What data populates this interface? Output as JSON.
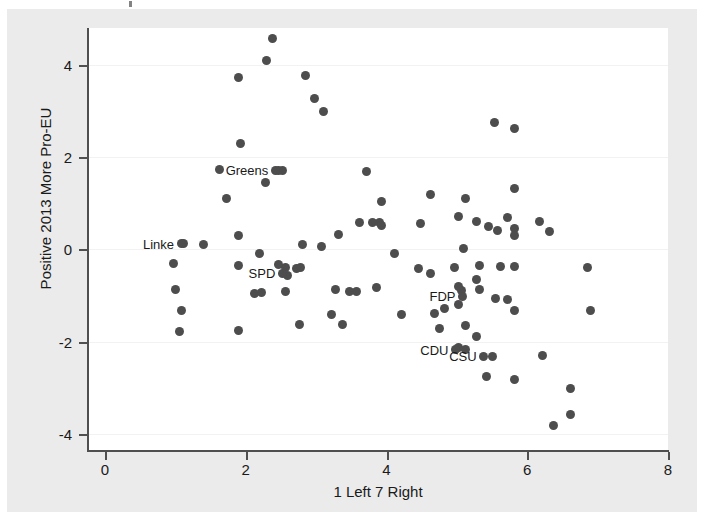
{
  "figure": {
    "background_color": "#ebebeb",
    "plot_background_color": "#ffffff",
    "marker_color": "#4d4d4d",
    "axis_color": "#4f4f4f",
    "gridline_color": "#f2f2f2"
  },
  "chart_data": {
    "type": "scatter",
    "title": "",
    "xlabel": "1 Left 7 Right",
    "ylabel": "Positive 2013 More Pro-EU",
    "xlim": [
      0,
      8
    ],
    "ylim": [
      -4.35,
      4.8
    ],
    "xticks": [
      0,
      2,
      4,
      6,
      8
    ],
    "xtick_labels": [
      "0",
      "2",
      "4",
      "6",
      "8"
    ],
    "yticks": [
      -4,
      -2,
      0,
      2,
      4
    ],
    "ytick_labels": [
      "-4",
      "-2",
      "0",
      "2",
      "4"
    ],
    "grid": "horizontal",
    "legend": "none",
    "annotations": [
      {
        "label": "Greens",
        "x": 2.42,
        "y": 1.72,
        "anchor": "right"
      },
      {
        "label": "Linke",
        "x": 1.08,
        "y": 0.12,
        "anchor": "right"
      },
      {
        "label": "SPD",
        "x": 2.52,
        "y": -0.52,
        "anchor": "right"
      },
      {
        "label": "FDP",
        "x": 5.08,
        "y": -1.02,
        "anchor": "right"
      },
      {
        "label": "CDU",
        "x": 4.98,
        "y": -2.18,
        "anchor": "right"
      },
      {
        "label": "CSU",
        "x": 5.38,
        "y": -2.32,
        "anchor": "right"
      }
    ],
    "points": [
      {
        "x": 2.38,
        "y": 4.58
      },
      {
        "x": 2.3,
        "y": 4.1
      },
      {
        "x": 1.9,
        "y": 3.72
      },
      {
        "x": 2.85,
        "y": 3.78
      },
      {
        "x": 2.98,
        "y": 3.28
      },
      {
        "x": 3.1,
        "y": 3.0
      },
      {
        "x": 1.92,
        "y": 2.3
      },
      {
        "x": 5.53,
        "y": 2.76
      },
      {
        "x": 5.82,
        "y": 2.62
      },
      {
        "x": 1.62,
        "y": 1.74
      },
      {
        "x": 2.46,
        "y": 1.72
      },
      {
        "x": 2.52,
        "y": 1.7
      },
      {
        "x": 2.28,
        "y": 1.46
      },
      {
        "x": 3.72,
        "y": 1.68
      },
      {
        "x": 5.82,
        "y": 1.32
      },
      {
        "x": 1.72,
        "y": 1.1
      },
      {
        "x": 4.62,
        "y": 1.18
      },
      {
        "x": 5.12,
        "y": 1.1
      },
      {
        "x": 3.93,
        "y": 1.04
      },
      {
        "x": 5.02,
        "y": 0.72
      },
      {
        "x": 5.72,
        "y": 0.7
      },
      {
        "x": 5.28,
        "y": 0.6
      },
      {
        "x": 6.18,
        "y": 0.6
      },
      {
        "x": 3.62,
        "y": 0.58
      },
      {
        "x": 3.8,
        "y": 0.58
      },
      {
        "x": 3.9,
        "y": 0.58
      },
      {
        "x": 3.93,
        "y": 0.52
      },
      {
        "x": 4.48,
        "y": 0.56
      },
      {
        "x": 5.45,
        "y": 0.5
      },
      {
        "x": 5.58,
        "y": 0.42
      },
      {
        "x": 5.82,
        "y": 0.46
      },
      {
        "x": 5.82,
        "y": 0.3
      },
      {
        "x": 6.32,
        "y": 0.38
      },
      {
        "x": 1.9,
        "y": 0.3
      },
      {
        "x": 3.32,
        "y": 0.32
      },
      {
        "x": 2.8,
        "y": 0.1
      },
      {
        "x": 3.08,
        "y": 0.06
      },
      {
        "x": 1.12,
        "y": 0.12
      },
      {
        "x": 1.4,
        "y": 0.1
      },
      {
        "x": 5.1,
        "y": 0.02
      },
      {
        "x": 2.2,
        "y": -0.08
      },
      {
        "x": 4.12,
        "y": -0.08
      },
      {
        "x": 0.98,
        "y": -0.3
      },
      {
        "x": 1.9,
        "y": -0.34
      },
      {
        "x": 2.46,
        "y": -0.32
      },
      {
        "x": 2.56,
        "y": -0.4
      },
      {
        "x": 2.72,
        "y": -0.42
      },
      {
        "x": 2.78,
        "y": -0.4
      },
      {
        "x": 2.6,
        "y": -0.56
      },
      {
        "x": 4.45,
        "y": -0.42
      },
      {
        "x": 4.62,
        "y": -0.52
      },
      {
        "x": 4.96,
        "y": -0.4
      },
      {
        "x": 5.32,
        "y": -0.34
      },
      {
        "x": 5.62,
        "y": -0.38
      },
      {
        "x": 5.82,
        "y": -0.38
      },
      {
        "x": 6.86,
        "y": -0.4
      },
      {
        "x": 1.0,
        "y": -0.88
      },
      {
        "x": 2.12,
        "y": -0.96
      },
      {
        "x": 2.22,
        "y": -0.94
      },
      {
        "x": 2.56,
        "y": -0.92
      },
      {
        "x": 3.28,
        "y": -0.88
      },
      {
        "x": 3.48,
        "y": -0.92
      },
      {
        "x": 3.58,
        "y": -0.92
      },
      {
        "x": 3.86,
        "y": -0.82
      },
      {
        "x": 5.02,
        "y": -0.8
      },
      {
        "x": 5.06,
        "y": -0.9
      },
      {
        "x": 5.32,
        "y": -0.88
      },
      {
        "x": 5.28,
        "y": -0.66
      },
      {
        "x": 5.55,
        "y": -1.06
      },
      {
        "x": 5.72,
        "y": -1.08
      },
      {
        "x": 4.82,
        "y": -1.28
      },
      {
        "x": 5.02,
        "y": -1.2
      },
      {
        "x": 5.82,
        "y": -1.32
      },
      {
        "x": 6.9,
        "y": -1.32
      },
      {
        "x": 1.08,
        "y": -1.32
      },
      {
        "x": 3.22,
        "y": -1.42
      },
      {
        "x": 4.22,
        "y": -1.42
      },
      {
        "x": 4.68,
        "y": -1.4
      },
      {
        "x": 2.76,
        "y": -1.62
      },
      {
        "x": 3.38,
        "y": -1.62
      },
      {
        "x": 1.06,
        "y": -1.78
      },
      {
        "x": 1.9,
        "y": -1.76
      },
      {
        "x": 4.75,
        "y": -1.72
      },
      {
        "x": 5.12,
        "y": -1.66
      },
      {
        "x": 5.28,
        "y": -1.88
      },
      {
        "x": 5.02,
        "y": -2.12
      },
      {
        "x": 5.12,
        "y": -2.18
      },
      {
        "x": 5.5,
        "y": -2.32
      },
      {
        "x": 6.22,
        "y": -2.3
      },
      {
        "x": 5.42,
        "y": -2.76
      },
      {
        "x": 5.82,
        "y": -2.82
      },
      {
        "x": 6.62,
        "y": -3.02
      },
      {
        "x": 6.62,
        "y": -3.58
      },
      {
        "x": 6.38,
        "y": -3.82
      }
    ]
  }
}
